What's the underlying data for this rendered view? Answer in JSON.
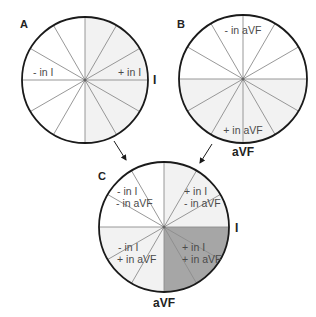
{
  "diagram": {
    "colors": {
      "outline": "#1a1a1a",
      "spoke": "#8c8c8c",
      "light_fill": "#f2f2f2",
      "dark_fill": "#a6a6a6",
      "white": "#ffffff"
    },
    "panels": [
      {
        "id": "A",
        "label": "A",
        "lead_label": "I",
        "regions": [
          {
            "text": "- in I"
          },
          {
            "text": "+ in I"
          }
        ]
      },
      {
        "id": "B",
        "label": "B",
        "lead_label": "aVF",
        "regions": [
          {
            "text": "- in aVF"
          },
          {
            "text": "+ in aVF"
          }
        ]
      },
      {
        "id": "C",
        "label": "C",
        "lead_label_right": "I",
        "lead_label_bottom": "aVF",
        "quadrants": [
          {
            "line1": "- in I",
            "line2": "- in aVF"
          },
          {
            "line1": "+ in I",
            "line2": "- in aVF"
          },
          {
            "line1": "- in I",
            "line2": "+ in aVF"
          },
          {
            "line1": "+ in I",
            "line2": "+ in aVF"
          }
        ]
      }
    ]
  }
}
